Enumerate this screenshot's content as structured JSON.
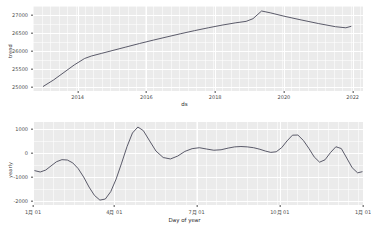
{
  "figure": {
    "type": "prophet-components-plot",
    "background_color": "#ffffff",
    "panel_color": "#ebebeb",
    "grid_color": "#ffffff",
    "line_color": "#4a4a5a",
    "panels": 2
  },
  "chart_data": [
    {
      "type": "line",
      "id": "trend",
      "title": "",
      "xlabel": "ds",
      "ylabel": "trend",
      "grid": true,
      "legend": null,
      "xticklabels": [
        "2014",
        "2016",
        "2018",
        "2020",
        "2022"
      ],
      "xtickvalues": [
        2014,
        2016,
        2018,
        2020,
        2022
      ],
      "xlim": [
        2012.7,
        2022.3
      ],
      "yticklabels": [
        "25000",
        "25500",
        "26000",
        "26500",
        "27000"
      ],
      "ytickvalues": [
        25000,
        25500,
        26000,
        26500,
        27000
      ],
      "ylim": [
        24880,
        27260
      ],
      "series": [
        {
          "name": "trend",
          "color": "#4a4a5a",
          "x": [
            2013.0,
            2013.3,
            2013.6,
            2013.9,
            2014.2,
            2014.4,
            2014.7,
            2015.0,
            2015.4,
            2015.8,
            2016.2,
            2016.6,
            2017.0,
            2017.4,
            2017.8,
            2018.2,
            2018.6,
            2018.9,
            2019.1,
            2019.35,
            2019.6,
            2020.0,
            2020.5,
            2021.0,
            2021.5,
            2021.8,
            2021.95
          ],
          "y": [
            25010,
            25190,
            25400,
            25610,
            25790,
            25860,
            25935,
            26010,
            26110,
            26210,
            26305,
            26395,
            26485,
            26570,
            26650,
            26725,
            26790,
            26830,
            26905,
            27120,
            27070,
            26975,
            26870,
            26770,
            26680,
            26650,
            26690
          ]
        }
      ]
    },
    {
      "type": "line",
      "id": "yearly",
      "title": "",
      "xlabel": "Day of year",
      "ylabel": "yearly",
      "grid": true,
      "legend": null,
      "xticklabels": [
        "1月 01",
        "4月 01",
        "7月 01",
        "10月 01",
        "1月 01"
      ],
      "xtickvalues": [
        1,
        91,
        182,
        274,
        366
      ],
      "xlim": [
        1,
        366
      ],
      "yticklabels": [
        "1000",
        "0",
        "-1000",
        "-2000"
      ],
      "ytickvalues": [
        1000,
        0,
        -1000,
        -2000
      ],
      "ylim": [
        -2180,
        1290
      ],
      "series": [
        {
          "name": "yearly",
          "color": "#4a4a5a",
          "x": [
            3,
            9,
            15,
            21,
            27,
            33,
            39,
            45,
            51,
            57,
            63,
            69,
            75,
            81,
            87,
            93,
            99,
            105,
            111,
            117,
            123,
            130,
            137,
            145,
            153,
            161,
            169,
            177,
            185,
            193,
            201,
            209,
            217,
            224,
            231,
            238,
            245,
            252,
            258,
            264,
            270,
            276,
            282,
            288,
            294,
            300,
            306,
            312,
            318,
            324,
            330,
            336,
            342,
            348,
            354,
            360,
            365
          ],
          "y": [
            -745,
            -800,
            -720,
            -545,
            -370,
            -285,
            -300,
            -420,
            -660,
            -1010,
            -1430,
            -1780,
            -1975,
            -1930,
            -1620,
            -1090,
            -430,
            260,
            830,
            1080,
            930,
            500,
            75,
            -195,
            -255,
            -135,
            60,
            175,
            215,
            160,
            110,
            130,
            200,
            250,
            265,
            250,
            215,
            150,
            75,
            20,
            45,
            215,
            500,
            740,
            745,
            520,
            195,
            -170,
            -390,
            -290,
            10,
            255,
            180,
            -215,
            -620,
            -835,
            -790
          ]
        }
      ]
    }
  ]
}
